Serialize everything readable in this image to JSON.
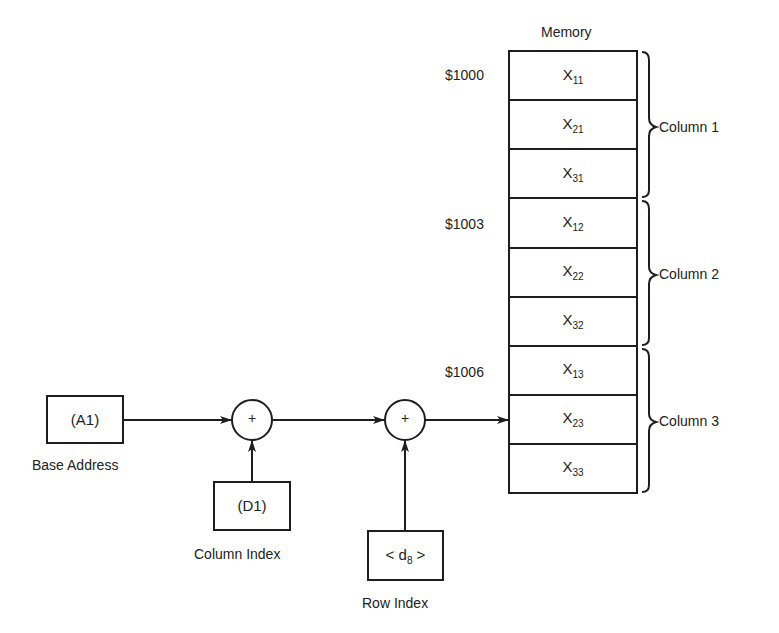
{
  "diagram": {
    "memory": {
      "title": "Memory",
      "cells": [
        {
          "base": "X",
          "sub": "11"
        },
        {
          "base": "X",
          "sub": "21"
        },
        {
          "base": "X",
          "sub": "31"
        },
        {
          "base": "X",
          "sub": "12"
        },
        {
          "base": "X",
          "sub": "22"
        },
        {
          "base": "X",
          "sub": "32"
        },
        {
          "base": "X",
          "sub": "13"
        },
        {
          "base": "X",
          "sub": "23"
        },
        {
          "base": "X",
          "sub": "33"
        }
      ],
      "addresses": [
        {
          "label": "$1000",
          "cell_index": 0
        },
        {
          "label": "$1003",
          "cell_index": 3
        },
        {
          "label": "$1006",
          "cell_index": 6
        }
      ],
      "groups": [
        {
          "label": "Column 1"
        },
        {
          "label": "Column 2"
        },
        {
          "label": "Column 3"
        }
      ]
    },
    "base_register": {
      "text": "(A1)",
      "caption": "Base Address"
    },
    "column_register": {
      "text": "(D1)",
      "caption": "Column Index"
    },
    "row_displacement": {
      "prefix": "< d",
      "sub": "8",
      "suffix": " >",
      "caption": "Row Index"
    },
    "adders": [
      {
        "symbol": "+"
      },
      {
        "symbol": "+"
      }
    ],
    "colors": {
      "line": "#1e1e1e",
      "background": "#ffffff"
    }
  }
}
